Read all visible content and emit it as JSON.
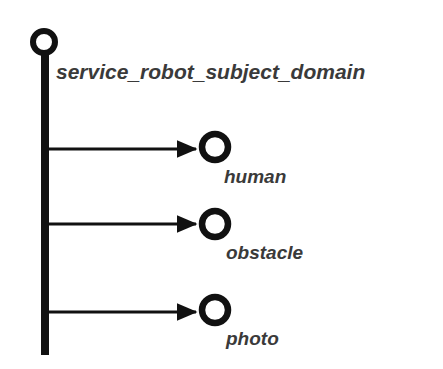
{
  "diagram": {
    "type": "tree",
    "root": {
      "label": "service_robot_subject_domain",
      "node_shape": "ring"
    },
    "children": [
      {
        "label": "human",
        "node_shape": "ring",
        "edge": "arrow"
      },
      {
        "label": "obstacle",
        "node_shape": "ring",
        "edge": "arrow"
      },
      {
        "label": "photo",
        "node_shape": "ring",
        "edge": "arrow"
      }
    ],
    "colors": {
      "stroke": "#111111",
      "text": "#3a3a3a",
      "background": "#ffffff"
    }
  }
}
